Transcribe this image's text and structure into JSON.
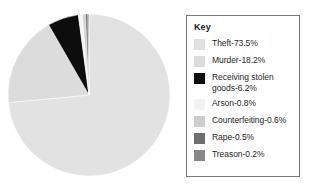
{
  "chart_data": {
    "type": "pie",
    "title": "",
    "categories": [
      "Theft",
      "Murder",
      "Receiving stolen goods",
      "Arson",
      "Counterfeiting",
      "Rape",
      "Treason"
    ],
    "values": [
      73.5,
      18.2,
      6.2,
      0.8,
      0.6,
      0.5,
      0.2
    ],
    "value_unit": "%",
    "colors": [
      "#e2e2e2",
      "#dcdcdc",
      "#0d0d0d",
      "#f4f4f4",
      "#cdcdcd",
      "#6e6e6e",
      "#878787"
    ],
    "legend_position": "right",
    "grid": false,
    "start_angle_deg": 0,
    "direction": "clockwise",
    "slices": [
      {
        "label": "Theft",
        "value": 73.5,
        "display": "Theft-73.5%",
        "color": "#e2e2e2"
      },
      {
        "label": "Murder",
        "value": 18.2,
        "display": "Murder-18.2%",
        "color": "#dcdcdc"
      },
      {
        "label": "Receiving stolen goods",
        "value": 6.2,
        "display": "Receiving stolen\ngoods-6.2%",
        "color": "#0d0d0d"
      },
      {
        "label": "Arson",
        "value": 0.8,
        "display": "Arson-0.8%",
        "color": "#f4f4f4"
      },
      {
        "label": "Counterfeiting",
        "value": 0.6,
        "display": "Counterfeiting-0.6%",
        "color": "#cdcdcd"
      },
      {
        "label": "Rape",
        "value": 0.5,
        "display": "Rape-0.5%",
        "color": "#6e6e6e"
      },
      {
        "label": "Treason",
        "value": 0.2,
        "display": "Treason-0.2%",
        "color": "#878787"
      }
    ]
  },
  "legend": {
    "title": "Key",
    "border_color": "#77797c",
    "items": [
      {
        "label": "Theft-73.5%",
        "color": "#e2e2e2"
      },
      {
        "label": "Murder-18.2%",
        "color": "#dcdcdc"
      },
      {
        "label": "Receiving stolen\ngoods-6.2%",
        "color": "#0d0d0d"
      },
      {
        "label": "Arson-0.8%",
        "color": "#f4f4f4"
      },
      {
        "label": "Counterfeiting-0.6%",
        "color": "#cdcdcd"
      },
      {
        "label": "Rape-0.5%",
        "color": "#6e6e6e"
      },
      {
        "label": "Treason-0.2%",
        "color": "#878787"
      }
    ]
  },
  "pie_geometry": {
    "cx": 89,
    "cy": 95,
    "r": 81
  }
}
